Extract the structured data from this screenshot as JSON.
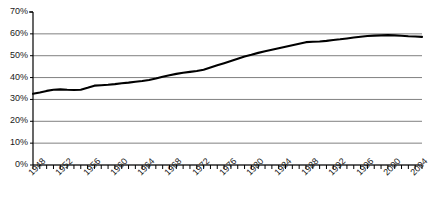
{
  "chart_data": {
    "type": "line",
    "title": "",
    "subtitle": "",
    "xlabel": "",
    "ylabel": "",
    "grid": "horizontal",
    "legend": "none",
    "xlim": [
      1948,
      2005
    ],
    "ylim": [
      0,
      70
    ],
    "y_tick_labels": [
      "70%",
      "60%",
      "50%",
      "40%",
      "30%",
      "20%",
      "10%",
      "0%"
    ],
    "y_ticks": [
      70,
      60,
      50,
      40,
      30,
      20,
      10,
      0
    ],
    "x_tick_labels": [
      "1948",
      "1952",
      "1956",
      "1960",
      "1964",
      "1968",
      "1972",
      "1976",
      "1980",
      "1984",
      "1988",
      "1992",
      "1996",
      "2000",
      "2004"
    ],
    "x_major_ticks": [
      1948,
      1952,
      1956,
      1960,
      1964,
      1968,
      1972,
      1976,
      1980,
      1984,
      1988,
      1992,
      1996,
      2000,
      2004
    ],
    "x_minor_tick_step": 1,
    "line_color": "#000000",
    "grid_color": "#808080",
    "axis_color": "#000000",
    "series": [
      {
        "name": "",
        "x": [
          1948,
          1949,
          1950,
          1951,
          1952,
          1953,
          1954,
          1955,
          1956,
          1957,
          1958,
          1959,
          1960,
          1961,
          1962,
          1963,
          1964,
          1965,
          1966,
          1967,
          1968,
          1969,
          1970,
          1971,
          1972,
          1973,
          1974,
          1975,
          1976,
          1977,
          1978,
          1979,
          1980,
          1981,
          1982,
          1983,
          1984,
          1985,
          1986,
          1987,
          1988,
          1989,
          1990,
          1991,
          1992,
          1993,
          1994,
          1995,
          1996,
          1997,
          1998,
          1999,
          2000,
          2001,
          2002,
          2003,
          2004,
          2005
        ],
        "values": [
          32.6,
          33.2,
          33.9,
          34.4,
          34.6,
          34.4,
          34.3,
          34.4,
          35.3,
          36.3,
          36.5,
          36.7,
          37.0,
          37.4,
          37.7,
          38.1,
          38.4,
          38.9,
          39.6,
          40.4,
          41.1,
          41.7,
          42.2,
          42.6,
          43.0,
          43.6,
          44.6,
          45.6,
          46.6,
          47.6,
          48.6,
          49.6,
          50.4,
          51.3,
          52.0,
          52.7,
          53.4,
          54.1,
          54.8,
          55.5,
          56.2,
          56.4,
          56.5,
          56.8,
          57.2,
          57.5,
          57.9,
          58.3,
          58.7,
          59.0,
          59.2,
          59.3,
          59.4,
          59.3,
          59.1,
          58.9,
          58.8,
          58.6
        ]
      }
    ]
  }
}
